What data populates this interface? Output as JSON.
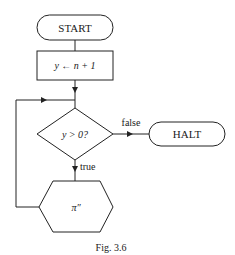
{
  "diagram": {
    "type": "flowchart",
    "nodes": {
      "start": {
        "label": "START",
        "shape": "terminal"
      },
      "assign": {
        "label": "y ← n + 1",
        "shape": "process"
      },
      "decision": {
        "label": "y > 0?",
        "shape": "decision"
      },
      "halt": {
        "label": "HALT",
        "shape": "terminal"
      },
      "program": {
        "label": "π″",
        "shape": "hexagon"
      }
    },
    "edges": [
      {
        "from": "start",
        "to": "assign",
        "label": ""
      },
      {
        "from": "assign",
        "to": "decision",
        "label": ""
      },
      {
        "from": "decision",
        "to": "halt",
        "label": "false"
      },
      {
        "from": "decision",
        "to": "program",
        "label": "true"
      },
      {
        "from": "program",
        "to": "decision",
        "label": ""
      }
    ],
    "edge_labels": {
      "false": "false",
      "true": "true"
    },
    "caption": "Fig. 3.6"
  }
}
